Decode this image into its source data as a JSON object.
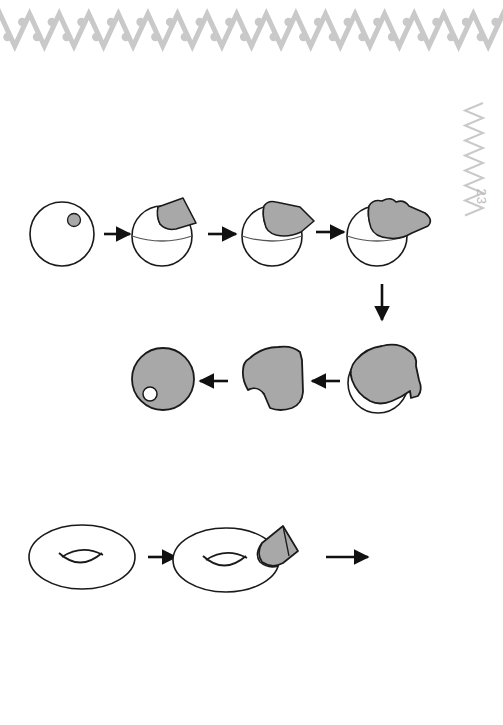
{
  "page": {
    "width": 503,
    "height": 725,
    "background_color": "#ffffff",
    "page_number": "23",
    "page_number_color": "#bdbdbd"
  },
  "ornaments": {
    "header_band": {
      "name": "zigzag-dot-border",
      "color": "#c9c9c9",
      "description": "horizontal zigzag chevron band with dots",
      "stroke_width": 5,
      "peak_count": 17
    },
    "side_marker": {
      "name": "vertical-zigzag-marker",
      "color": "#c9c9c9",
      "description": "vertical zigzag above page number",
      "stroke_width": 2
    }
  },
  "palette": {
    "outline": "#1a1a1a",
    "fill_gray": "#a8a8a8",
    "thin_outline": "#333333",
    "white": "#ffffff",
    "ornament_gray": "#c9c9c9"
  },
  "diagram": {
    "title": "",
    "rows": [
      {
        "id": "row-1",
        "name": "sphere-peeling-row-top",
        "steps": [
          {
            "id": "s1",
            "name": "sphere-with-puncture",
            "label": ""
          },
          {
            "id": "s2",
            "name": "sphere-peel-start",
            "label": ""
          },
          {
            "id": "s3",
            "name": "sphere-peel-mid",
            "label": ""
          },
          {
            "id": "s4",
            "name": "sphere-peel-more",
            "label": ""
          }
        ],
        "arrows": [
          "arrow-right",
          "arrow-right",
          "arrow-right"
        ]
      },
      {
        "id": "row-2",
        "name": "sphere-peeling-row-bottom",
        "steps": [
          {
            "id": "s8",
            "name": "filled-disk-with-hole",
            "label": ""
          },
          {
            "id": "s7",
            "name": "flattened-peel-blob",
            "label": ""
          },
          {
            "id": "s6",
            "name": "sphere-mostly-peeled",
            "label": ""
          }
        ],
        "arrows": [
          "arrow-left",
          "arrow-left"
        ]
      },
      {
        "id": "row-3",
        "name": "torus-peeling-row",
        "steps": [
          {
            "id": "t1",
            "name": "torus-plain",
            "label": ""
          },
          {
            "id": "t2",
            "name": "torus-peel-start",
            "label": ""
          }
        ],
        "arrows": [
          "arrow-right",
          "arrow-right"
        ]
      }
    ],
    "connector_arrows": [
      {
        "id": "a-vert",
        "name": "arrow-down-connector",
        "direction": "down"
      }
    ]
  }
}
